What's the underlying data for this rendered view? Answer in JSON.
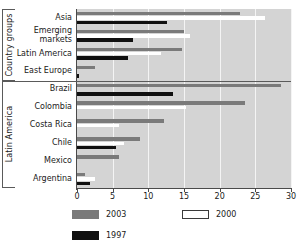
{
  "chart_data": {
    "type": "bar",
    "orientation": "horizontal",
    "title": "",
    "xlabel": "",
    "ylabel": "",
    "xlim": [
      0,
      30
    ],
    "xticks": [
      0,
      5,
      10,
      15,
      20,
      25,
      30
    ],
    "grid": true,
    "legend_position": "bottom",
    "series": [
      {
        "name": "2003",
        "color": "#7a7a7a",
        "values": [
          22.8,
          15.0,
          14.7,
          2.5,
          28.6,
          23.5,
          12.2,
          8.9,
          5.9,
          1.1
        ]
      },
      {
        "name": "2000",
        "color": "#ffffff",
        "values": [
          26.3,
          15.8,
          11.8,
          0.0,
          0.0,
          15.3,
          5.9,
          6.6,
          0.0,
          2.5
        ]
      },
      {
        "name": "1997",
        "color": "#101010",
        "values": [
          12.6,
          7.8,
          7.2,
          0.3,
          13.5,
          0.0,
          0.0,
          5.5,
          0.0,
          1.8
        ]
      }
    ],
    "categories": [
      "Asia",
      "Emerging\nmarkets",
      "Latin America",
      "East Europe",
      "Brazil",
      "Colombia",
      "Costa Rica",
      "Chile",
      "Mexico",
      "Argentina"
    ],
    "groups": [
      {
        "label": "Country groups",
        "start": 0,
        "end": 3
      },
      {
        "label": "Latin America",
        "start": 4,
        "end": 9
      }
    ]
  },
  "legend": {
    "items": [
      {
        "label": "2003",
        "swatch": "s2003"
      },
      {
        "label": "2000",
        "swatch": "s2000"
      },
      {
        "label": "1997",
        "swatch": "s1997"
      }
    ]
  }
}
